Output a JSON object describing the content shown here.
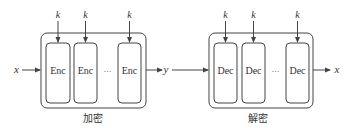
{
  "diagram": {
    "encryption": {
      "input_label": "x",
      "output_label": "y",
      "key_label": "k",
      "blocks": [
        "Enc",
        "Enc",
        "Enc"
      ],
      "ellipsis": "···",
      "caption": "加密"
    },
    "decryption": {
      "input_label": "y",
      "output_label": "x",
      "key_label": "k",
      "blocks": [
        "Dec",
        "Dec",
        "Dec"
      ],
      "ellipsis": "···",
      "caption": "解密"
    },
    "colors": {
      "stroke": "#444444",
      "text": "#333333",
      "background": "#ffffff"
    }
  }
}
